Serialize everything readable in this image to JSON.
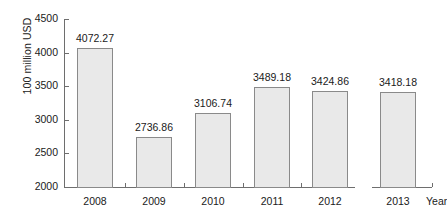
{
  "chart_data": {
    "type": "bar",
    "title": "",
    "subtitle": "",
    "xlabel": "Year",
    "ylabel": "100 million USD",
    "categories": [
      "2008",
      "2009",
      "2010",
      "2011",
      "2012",
      "2013"
    ],
    "values": [
      4072.27,
      2736.86,
      3106.74,
      3489.18,
      3424.86,
      3418.18
    ],
    "value_labels": [
      "4072.27",
      "2736.86",
      "3106.74",
      "3489.18",
      "3424.86",
      "3418.18"
    ],
    "ylim": [
      2000,
      4500
    ],
    "ytick_labels": [
      "2000",
      "2500",
      "3000",
      "3500",
      "4000",
      "4500"
    ],
    "ytick_values": [
      2000,
      2500,
      3000,
      3500,
      4000,
      4500
    ],
    "grid": false,
    "legend": null,
    "axis_break_after_category": "2012",
    "colors": {
      "bar_fill": "#e9e9e9",
      "bar_stroke": "#8a8a8a",
      "axis": "#6e6e6e",
      "text": "#1a1a1a",
      "background": "#ffffff"
    }
  }
}
